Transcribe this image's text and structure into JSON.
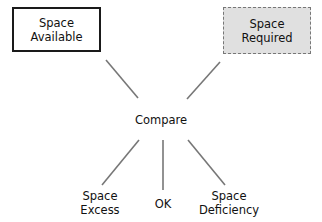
{
  "diagram": {
    "inputs": [
      {
        "id": "available",
        "label_line1": "Space",
        "label_line2": "Available",
        "style": "solid"
      },
      {
        "id": "required",
        "label_line1": "Space",
        "label_line2": "Required",
        "style": "dashed-shaded"
      }
    ],
    "center": {
      "label": "Compare"
    },
    "outcomes": [
      {
        "id": "excess",
        "label_line1": "Space",
        "label_line2": "Excess"
      },
      {
        "id": "ok",
        "label_line1": "OK",
        "label_line2": ""
      },
      {
        "id": "deficiency",
        "label_line1": "Space",
        "label_line2": "Deficiency"
      }
    ],
    "colors": {
      "line": "#777777",
      "shaded_fill": "#e0e0e0",
      "solid_border": "#1a1a1a"
    }
  }
}
